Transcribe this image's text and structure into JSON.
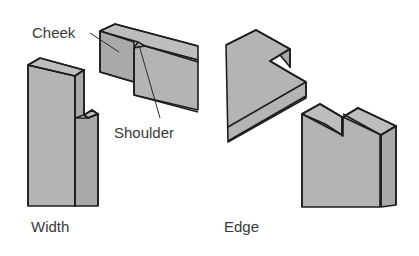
{
  "diagram": {
    "type": "joinery-illustration",
    "labels": {
      "cheek": "Cheek",
      "shoulder": "Shoulder",
      "width": "Width",
      "edge": "Edge"
    },
    "colors": {
      "wood_face": "#b4b4b4",
      "outline": "#1e1e1e",
      "label_text": "#3a3a3a",
      "background": "#ffffff"
    },
    "groups": [
      {
        "name": "Width",
        "pieces": [
          "upright board with notch on width",
          "horizontal board with cheek and shoulder"
        ]
      },
      {
        "name": "Edge",
        "pieces": [
          "board with notch cut into edge",
          "upright board with notch cut into edge"
        ]
      }
    ]
  }
}
